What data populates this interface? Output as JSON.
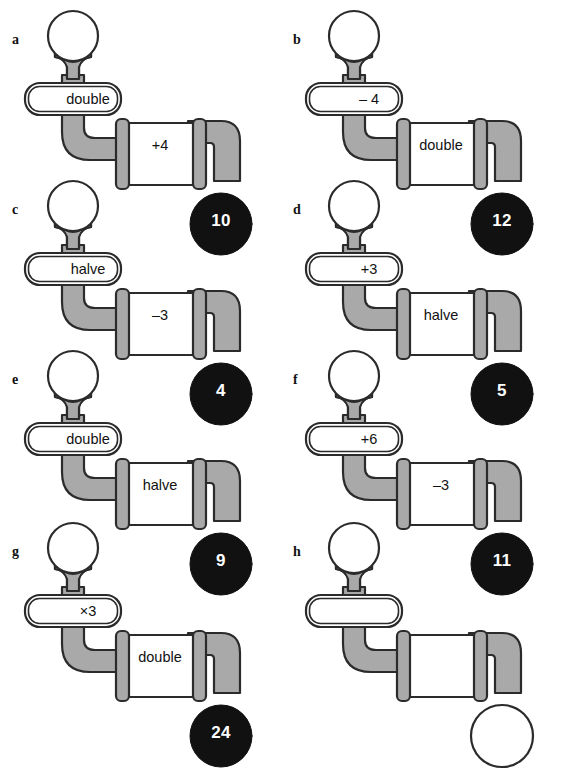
{
  "page": {
    "faint_header": "",
    "background_color": "#ffffff",
    "pipe_fill_color": "#a9a9a9",
    "pipe_stroke_color": "#2b2b2b",
    "box_fill_color": "#ffffff",
    "result_fill_color": "#111111",
    "result_text_color": "#ffffff"
  },
  "panels": [
    {
      "label": "a",
      "operation_1": "double",
      "operation_2": "+4",
      "result": "10",
      "result_filled": true
    },
    {
      "label": "b",
      "operation_1": "– 4",
      "operation_2": "double",
      "result": "12",
      "result_filled": true
    },
    {
      "label": "c",
      "operation_1": "halve",
      "operation_2": "–3",
      "result": "4",
      "result_filled": true
    },
    {
      "label": "d",
      "operation_1": "+3",
      "operation_2": "halve",
      "result": "5",
      "result_filled": true
    },
    {
      "label": "e",
      "operation_1": "double",
      "operation_2": "halve",
      "result": "9",
      "result_filled": true
    },
    {
      "label": "f",
      "operation_1": "+6",
      "operation_2": "–3",
      "result": "11",
      "result_filled": true
    },
    {
      "label": "g",
      "operation_1": "×3",
      "operation_2": "double",
      "result": "24",
      "result_filled": true
    },
    {
      "label": "h",
      "operation_1": "",
      "operation_2": "",
      "result": "",
      "result_filled": false
    }
  ]
}
